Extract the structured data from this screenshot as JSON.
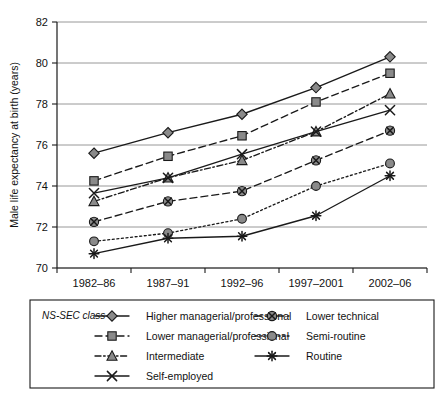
{
  "chart_data": {
    "type": "line",
    "title": "",
    "xlabel": "",
    "ylabel": "Male life expectancy at birth (years)",
    "categories": [
      "1982–86",
      "1987–91",
      "1992–96",
      "1997–2001",
      "2002–06"
    ],
    "ylim": [
      70,
      82
    ],
    "yticks": [
      70,
      72,
      74,
      76,
      78,
      80,
      82
    ],
    "ytick_labels": [
      "70",
      "72",
      "74",
      "76",
      "78",
      "80",
      "82"
    ],
    "grid": true,
    "legend_position": "below",
    "legend_title": "NS-SEC class",
    "series": [
      {
        "name": "Higher managerial/professional",
        "values": [
          75.6,
          76.6,
          77.5,
          78.8,
          80.3
        ],
        "marker": "diamond",
        "dash": "solid"
      },
      {
        "name": "Lower managerial/professional",
        "values": [
          74.25,
          75.45,
          76.45,
          78.1,
          79.5
        ],
        "marker": "square",
        "dash": "dashed"
      },
      {
        "name": "Intermediate",
        "values": [
          73.25,
          74.4,
          75.25,
          76.65,
          78.5
        ],
        "marker": "triangle",
        "dash": "dash-dot"
      },
      {
        "name": "Self-employed",
        "values": [
          73.65,
          74.4,
          75.55,
          76.65,
          77.7
        ],
        "marker": "cross",
        "dash": "solid"
      },
      {
        "name": "Lower technical",
        "values": [
          72.25,
          73.25,
          73.75,
          75.25,
          76.7
        ],
        "marker": "circle-cross",
        "dash": "dashed"
      },
      {
        "name": "Semi-routine",
        "values": [
          71.3,
          71.7,
          72.4,
          74.0,
          75.1
        ],
        "marker": "circle",
        "dash": "dotted"
      },
      {
        "name": "Routine",
        "values": [
          70.7,
          71.45,
          71.55,
          72.55,
          74.5
        ],
        "marker": "asterisk",
        "dash": "solid"
      }
    ]
  },
  "colors": {
    "axis": "#1a1a1a",
    "grid": "#8c8c8c",
    "marker_fill": "#8a8a8a",
    "background": "#ffffff"
  },
  "legend": {
    "title": "NS-SEC class",
    "column_left": [
      "Higher managerial/professional",
      "Lower managerial/professional",
      "Intermediate",
      "Self-employed"
    ],
    "column_right": [
      "Lower technical",
      "Semi-routine",
      "Routine"
    ]
  }
}
